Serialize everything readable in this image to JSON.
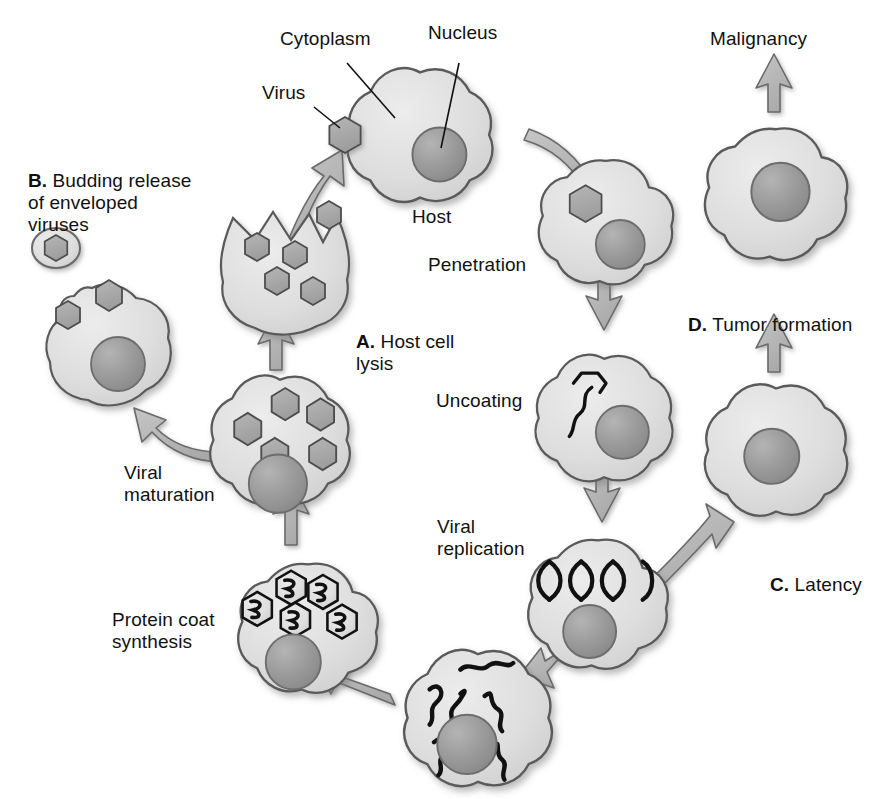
{
  "diagram": {
    "type": "biological-process-diagram",
    "colors": {
      "cell_fill": "#d9d9d9",
      "cell_fill_light": "#e4e4e4",
      "cell_outline": "#5a5a5a",
      "nucleus_fill": "#9a9a9a",
      "nucleus_outline": "#6d6d6d",
      "virus_fill": "#a6a6a6",
      "virus_outline": "#4d4d4d",
      "arrow_fill": "#b5b5b5",
      "arrow_outline": "#6a6a6a",
      "nucleic_acid": "#111111",
      "text": "#111111",
      "background": "#ffffff"
    },
    "labels": {
      "cytoplasm": "Cytoplasm",
      "nucleus": "Nucleus",
      "virus": "Virus",
      "host": "Host",
      "penetration": "Penetration",
      "uncoating": "Uncoating",
      "viral_replication": "Viral\nreplication",
      "protein_coat_synthesis": "Protein coat\nsynthesis",
      "viral_maturation": "Viral\nmaturation",
      "malignancy": "Malignancy"
    },
    "lettered_labels": [
      {
        "letter": "A.",
        "text": " Host cell\nlysis",
        "name": "host-cell-lysis"
      },
      {
        "letter": "B.",
        "text": " Budding release\nof enveloped\nviruses",
        "name": "budding-release"
      },
      {
        "letter": "C.",
        "text": " Latency",
        "name": "latency"
      },
      {
        "letter": "D.",
        "text": " Tumor formation",
        "name": "tumor-formation"
      }
    ],
    "stages": [
      {
        "id": "host",
        "label": "Host",
        "contents": "nucleus, attached virus"
      },
      {
        "id": "penetration",
        "label": "Penetration",
        "contents": "nucleus, internalized virus hexagon"
      },
      {
        "id": "uncoating",
        "label": "Uncoating",
        "contents": "nucleus, opened capsid releasing nucleic acid"
      },
      {
        "id": "viral-replication",
        "label": "Viral replication",
        "contents": "nucleus, DNA double helix"
      },
      {
        "id": "nucleic-acid-copies",
        "label": "",
        "contents": "nucleus, many nucleic acid strands"
      },
      {
        "id": "protein-coat-synthesis",
        "label": "Protein coat synthesis",
        "contents": "nucleus, 5 capsids containing nucleic acid"
      },
      {
        "id": "viral-maturation",
        "label": "Viral maturation",
        "contents": "nucleus, 5 mature virions"
      },
      {
        "id": "host-cell-lysis",
        "label": "A. Host cell lysis",
        "contents": "ruptured cell, 5 virions escaping"
      },
      {
        "id": "budding-release",
        "label": "B. Budding release of enveloped viruses",
        "contents": "nucleus, 2 budding virions"
      },
      {
        "id": "free-enveloped-virus",
        "label": "",
        "contents": "enveloped virion"
      },
      {
        "id": "latency",
        "label": "C. Latency",
        "contents": "quiescent cell with nucleus"
      },
      {
        "id": "tumor-formation",
        "label": "D. Tumor formation",
        "contents": "transformed cell with nucleus"
      },
      {
        "id": "malignancy",
        "label": "Malignancy",
        "contents": "outcome"
      }
    ]
  }
}
